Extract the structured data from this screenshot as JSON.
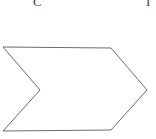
{
  "figure": {
    "width": 156,
    "height": 139,
    "background_color": "#ffffff",
    "labels": [
      {
        "id": "label-c",
        "text": "C",
        "note": "clipped at top edge of crop"
      },
      {
        "id": "label-right",
        "text": "I",
        "note": "partial vertical stroke clipped at top-right edge of crop"
      }
    ],
    "shape": {
      "name": "chevron-arrow-polygon",
      "stroke_color": "#6b6b6b",
      "fill_color": "none",
      "stroke_width": 1,
      "points": "3,47 111,48 147,90 111,130 3,131 40,90"
    }
  }
}
